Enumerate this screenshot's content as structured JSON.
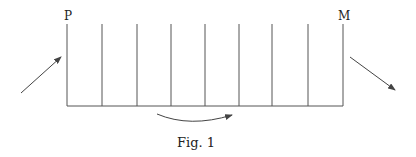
{
  "figure": {
    "caption": "Fig. 1",
    "labels": {
      "left": "P",
      "right": "M"
    },
    "colors": {
      "line": "#555555",
      "text": "#222222",
      "background": "#ffffff"
    },
    "vertical_lines_x": [
      67,
      102,
      137,
      171,
      205,
      239,
      272,
      308,
      343
    ],
    "line_top_y": 24,
    "baseline_y": 106,
    "arrows": [
      {
        "name": "incoming-arrow",
        "from": [
          21,
          93
        ],
        "to": [
          62,
          57
        ]
      },
      {
        "name": "outgoing-arrow",
        "from": [
          350,
          57
        ],
        "to": [
          396,
          91
        ]
      },
      {
        "name": "curved-arrow",
        "from": [
          157,
          114
        ],
        "to": [
          232,
          115
        ]
      }
    ]
  }
}
